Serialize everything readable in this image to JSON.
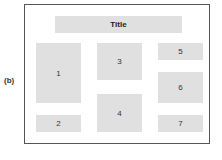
{
  "figure_label": "(b)",
  "layout": {
    "title": "Title",
    "panels": [
      {
        "id": "1",
        "label": "1"
      },
      {
        "id": "2",
        "label": "2"
      },
      {
        "id": "3",
        "label": "3"
      },
      {
        "id": "4",
        "label": "4"
      },
      {
        "id": "5",
        "label": "5"
      },
      {
        "id": "6",
        "label": "6"
      },
      {
        "id": "7",
        "label": "7"
      }
    ]
  },
  "colors": {
    "panel_fill": "#e0e0e0",
    "frame_border": "#555555"
  }
}
